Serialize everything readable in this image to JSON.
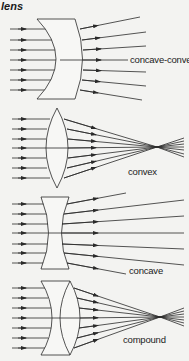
{
  "title": "lens",
  "colors": {
    "background": "#f3f3f1",
    "lens_fill": "#f7f7f5",
    "line": "#2a2a2a"
  },
  "lenses": [
    {
      "id": "concave-convex",
      "label": "concave-convex",
      "label_pos": [
        129,
        54
      ]
    },
    {
      "id": "convex",
      "label": "convex",
      "label_pos": [
        127,
        167
      ]
    },
    {
      "id": "concave",
      "label": "concave",
      "label_pos": [
        128,
        265
      ]
    },
    {
      "id": "compound",
      "label": "compound",
      "label_pos": [
        122,
        335
      ]
    }
  ]
}
